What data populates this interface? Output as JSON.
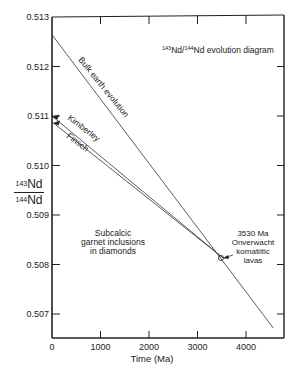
{
  "chart_data": {
    "type": "line",
    "title": "143Nd/144Nd evolution diagram",
    "title_parts": {
      "sup1": "143",
      "mid": "Nd/",
      "sup2": "144",
      "end": "Nd evolution diagram"
    },
    "xlabel": "Time (Ma)",
    "ylabel": {
      "numerator_mass": "143",
      "numerator": "Nd",
      "denominator_mass": "144",
      "denominator": "Nd"
    },
    "xlim": [
      0,
      4780
    ],
    "ylim": [
      0.5065,
      0.513
    ],
    "x_ticks": [
      0,
      1000,
      2000,
      3000,
      4000
    ],
    "x_tick_labels": [
      "0",
      "1000",
      "2000",
      "3000",
      "4000"
    ],
    "y_ticks": [
      0.507,
      0.508,
      0.509,
      0.51,
      0.511,
      0.512,
      0.513
    ],
    "y_tick_labels": [
      "0.507",
      "0.508",
      "0.509",
      "0.510",
      "0.511",
      "0.512",
      "0.513"
    ],
    "grid": false,
    "series": [
      {
        "name": "Bulk earth evolution",
        "x": [
          0,
          4560
        ],
        "y": [
          0.51264,
          0.50672
        ]
      },
      {
        "name": "Kimberley",
        "x": [
          0,
          3530
        ],
        "y": [
          0.511,
          0.50813
        ]
      },
      {
        "name": "Finsch",
        "x": [
          0,
          3530
        ],
        "y": [
          0.51088,
          0.50813
        ]
      }
    ],
    "annotations": [
      {
        "text": "Subcalcic garnet inclusions in diamonds",
        "lines": [
          "Subcalcic",
          "garnet inclusions",
          "in diamonds"
        ]
      },
      {
        "text": "3530 Ma Onverwacht komatiitic lavas",
        "lines": [
          "3530 Ma",
          "Onverwacht",
          "komatiitic",
          "lavas"
        ],
        "point": {
          "x": 3530,
          "y": 0.50813
        }
      }
    ]
  }
}
